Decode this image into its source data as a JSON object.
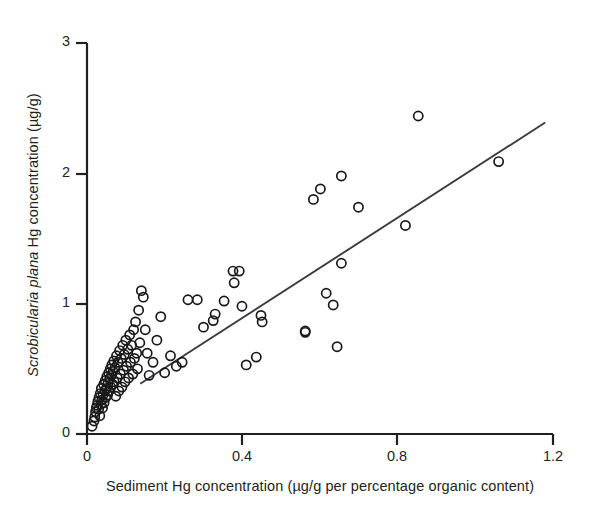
{
  "chart_data": {
    "type": "scatter",
    "title": "",
    "xlabel": "Sediment Hg concentration (µg/g per percentage organic content)",
    "ylabel_italic_part": "Scrobicularia plana",
    "ylabel_rest": " Hg concentration (µg/g)",
    "ylabel": "Scrobicularia plana Hg concentration (µg/g)",
    "xlim": [
      0,
      1.2
    ],
    "ylim": [
      0,
      3
    ],
    "xticks": [
      0,
      0.4,
      0.8,
      1.2
    ],
    "xtick_labels": [
      "0",
      "0.4",
      "0.8",
      "1.2"
    ],
    "yticks": [
      0,
      1,
      2,
      3
    ],
    "ytick_labels": [
      "0",
      "1",
      "2",
      "3"
    ],
    "grid": false,
    "legend": null,
    "marker": "open-circle",
    "marker_color": "#1a1a1a",
    "marker_fill": "none",
    "trend_line": {
      "type": "linear-regression",
      "color": "#3b3b42",
      "x_start": 0.137,
      "y_start": 0.385,
      "x_end": 1.18,
      "y_end": 2.39,
      "slope": 1.92,
      "intercept": 0.12
    },
    "x": [
      0.013,
      0.018,
      0.02,
      0.022,
      0.024,
      0.026,
      0.028,
      0.03,
      0.031,
      0.033,
      0.034,
      0.036,
      0.037,
      0.038,
      0.04,
      0.041,
      0.043,
      0.044,
      0.046,
      0.047,
      0.048,
      0.05,
      0.051,
      0.053,
      0.054,
      0.056,
      0.057,
      0.058,
      0.06,
      0.061,
      0.063,
      0.064,
      0.066,
      0.067,
      0.069,
      0.07,
      0.072,
      0.074,
      0.076,
      0.078,
      0.08,
      0.082,
      0.084,
      0.086,
      0.088,
      0.09,
      0.092,
      0.094,
      0.096,
      0.098,
      0.1,
      0.102,
      0.105,
      0.107,
      0.11,
      0.112,
      0.115,
      0.118,
      0.12,
      0.122,
      0.125,
      0.128,
      0.13,
      0.133,
      0.136,
      0.14,
      0.145,
      0.15,
      0.155,
      0.16,
      0.17,
      0.18,
      0.19,
      0.2,
      0.215,
      0.23,
      0.245,
      0.26,
      0.284,
      0.3,
      0.325,
      0.33,
      0.353,
      0.376,
      0.379,
      0.392,
      0.399,
      0.41,
      0.436,
      0.448,
      0.451,
      0.562,
      0.562,
      0.583,
      0.601,
      0.616,
      0.634,
      0.644,
      0.655,
      0.655,
      0.699,
      0.82,
      0.853,
      1.06
    ],
    "y": [
      0.06,
      0.1,
      0.13,
      0.17,
      0.2,
      0.22,
      0.25,
      0.19,
      0.28,
      0.14,
      0.31,
      0.23,
      0.35,
      0.26,
      0.2,
      0.3,
      0.38,
      0.24,
      0.33,
      0.41,
      0.28,
      0.35,
      0.44,
      0.3,
      0.39,
      0.47,
      0.33,
      0.42,
      0.5,
      0.36,
      0.45,
      0.53,
      0.38,
      0.48,
      0.56,
      0.4,
      0.51,
      0.29,
      0.6,
      0.43,
      0.55,
      0.33,
      0.64,
      0.46,
      0.58,
      0.36,
      0.68,
      0.49,
      0.61,
      0.4,
      0.72,
      0.52,
      0.65,
      0.43,
      0.76,
      0.55,
      0.68,
      0.46,
      0.8,
      0.58,
      0.86,
      0.62,
      0.5,
      0.95,
      0.7,
      1.1,
      1.05,
      0.8,
      0.62,
      0.45,
      0.55,
      0.72,
      0.9,
      0.47,
      0.6,
      0.52,
      0.55,
      1.03,
      1.03,
      0.82,
      0.87,
      0.92,
      1.02,
      1.25,
      1.16,
      1.25,
      0.98,
      0.53,
      0.59,
      0.91,
      0.86,
      0.78,
      0.79,
      1.8,
      1.88,
      1.08,
      0.99,
      0.67,
      1.31,
      1.98,
      1.74,
      1.6,
      2.44,
      2.09
    ]
  }
}
